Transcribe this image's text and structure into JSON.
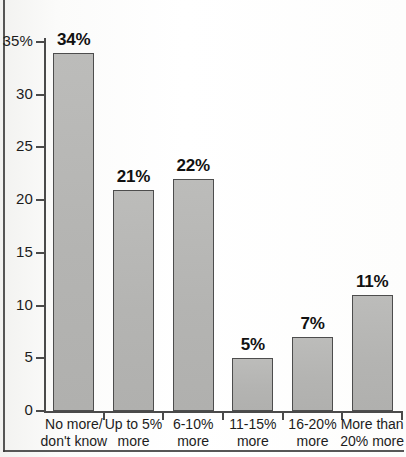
{
  "chart_data": {
    "type": "bar",
    "title": "",
    "subtitle": "",
    "xlabel": "",
    "ylabel": "",
    "ylim": [
      0,
      35
    ],
    "grid": false,
    "legend": "none",
    "y_ticks": [
      "0",
      "5",
      "10",
      "15",
      "20",
      "25",
      "30",
      "35%"
    ],
    "y_tick_values": [
      0,
      5,
      10,
      15,
      20,
      25,
      30,
      35
    ],
    "categories": [
      "No more/ don't know",
      "Up to 5% more",
      "6-10% more",
      "11-15% more",
      "16-20% more",
      "More than 20% more"
    ],
    "category_lines": [
      [
        "No more/",
        "don't know"
      ],
      [
        "Up to 5%",
        "more"
      ],
      [
        "6-10%",
        "more"
      ],
      [
        "11-15%",
        "more"
      ],
      [
        "16-20%",
        "more"
      ],
      [
        "More than",
        "20% more"
      ]
    ],
    "values": [
      34,
      21,
      22,
      5,
      7,
      11
    ],
    "data_labels": [
      "34%",
      "21%",
      "22%",
      "5%",
      "7%",
      "11%"
    ],
    "colors": {
      "bar_fill": "#b6b6b4",
      "bar_stroke": "#4d4d4d",
      "axis": "#4a4a4a",
      "text": "#1c1c1c",
      "background": "#fbfbf9",
      "frame": "#3a3a3a"
    }
  }
}
